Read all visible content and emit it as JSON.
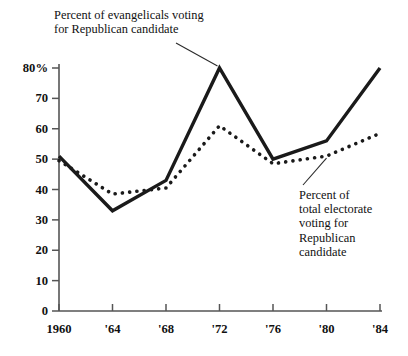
{
  "chart_data": {
    "type": "line",
    "title": "",
    "subtitle": "",
    "xlabel": "",
    "ylabel": "",
    "x": [
      1960,
      1964,
      1968,
      1972,
      1976,
      1980,
      1984
    ],
    "x_tick_labels": [
      "1960",
      "'64",
      "'68",
      "'72",
      "'76",
      "'80",
      "'84"
    ],
    "y_tick_labels": [
      "80%",
      "70",
      "60",
      "50",
      "40",
      "30",
      "20",
      "10",
      "0"
    ],
    "y_tick_values": [
      80,
      70,
      60,
      50,
      40,
      30,
      20,
      10,
      0
    ],
    "ylim": [
      0,
      80
    ],
    "xlim": [
      1960,
      1984
    ],
    "grid": false,
    "legend_position": "inline-annotations",
    "series": [
      {
        "name": "Percent of evangelicals voting for Republican candidate",
        "style": "solid",
        "color": "#1a1a1a",
        "values": [
          51,
          33,
          43,
          80,
          50,
          56,
          80
        ]
      },
      {
        "name": "Percent of total electorate voting for Republican candidate",
        "style": "dotted",
        "color": "#1a1a1a",
        "values": [
          49.5,
          38.5,
          40.5,
          61,
          48.5,
          51,
          58.5
        ]
      }
    ],
    "annotations": [
      {
        "id": "evangelicals",
        "text": "Percent of evangelicals voting\nfor Republican candidate",
        "target_x": 1972,
        "target_y": 80
      },
      {
        "id": "electorate",
        "text": "Percent of\ntotal electorate\nvoting for\nRepublican\ncandidate",
        "target_x": 1980,
        "target_y": 51
      }
    ]
  },
  "axis": {
    "y_labels": [
      "80%",
      "70",
      "60",
      "50",
      "40",
      "30",
      "20",
      "10",
      "0"
    ],
    "x_labels": [
      "1960",
      "'64",
      "'68",
      "'72",
      "'76",
      "'80",
      "'84"
    ]
  },
  "annotations": {
    "evangelicals": "Percent of evangelicals voting\nfor Republican candidate",
    "electorate": "Percent of\ntotal electorate\nvoting for\nRepublican\ncandidate"
  },
  "colors": {
    "ink": "#1a1a1a",
    "axis": "#555555",
    "background": "#ffffff"
  }
}
